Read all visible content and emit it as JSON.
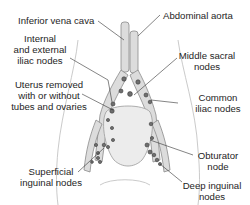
{
  "diagram": {
    "labels": {
      "inferior_vena_cava": "Inferior vena cava",
      "abdominal_aorta": "Abdominal aorta",
      "internal_external_iliac_1": "Internal",
      "internal_external_iliac_2": "and external",
      "internal_external_iliac_3": "iliac nodes",
      "middle_sacral_1": "Middle sacral",
      "middle_sacral_2": "nodes",
      "uterus_1": "Uterus removed",
      "uterus_2": "with or without",
      "uterus_3": "tubes and ovaries",
      "common_iliac_1": "Common",
      "common_iliac_2": "iliac nodes",
      "obturator_1": "Obturator",
      "obturator_2": "node",
      "superficial_inguinal_1": "Superficial",
      "superficial_inguinal_2": "inguinal nodes",
      "deep_inguinal_1": "Deep inguinal",
      "deep_inguinal_2": "nodes"
    },
    "colors": {
      "vessel_fill": "#d9d9d9",
      "vessel_stroke": "#8a8a8a",
      "node_fill": "#6e6e6e",
      "leader_line": "#333333",
      "body_outline": "#b5b5b5"
    }
  }
}
